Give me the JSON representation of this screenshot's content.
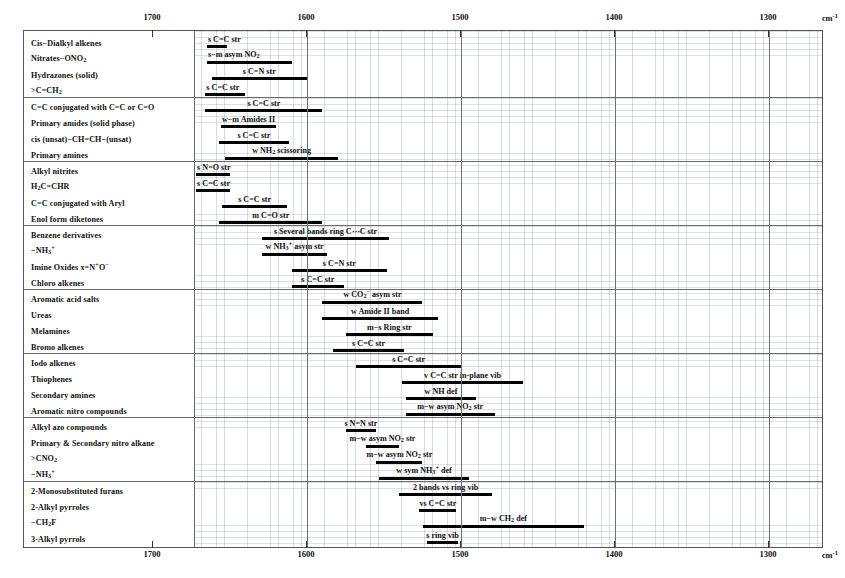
{
  "axis": {
    "unit": "cm",
    "unit_sup": "-1",
    "ticks": [
      1700,
      1600,
      1500,
      1400,
      1300
    ],
    "range_max": 1750,
    "range_min": 1250
  },
  "chart_data": {
    "type": "bar",
    "xlabel": "cm-1",
    "ylabel": "",
    "xlim": [
      1750,
      1250
    ],
    "grid": true,
    "legend": "none",
    "orientation": "horizontal-ranges",
    "categories": [
      "Cis−Dialkyl alkenes",
      "Nitrates−ONO2",
      "Hydrazones (solid)",
      ">C=CH2",
      "C=C conjugated with C=C or C=O",
      "Primary amides (solid phase)",
      "cis (unsat)−CH=CH−(unsat)",
      "Primary amines",
      "Alkyl nitrites",
      "H2C=CHR",
      "C=C conjugated with Aryl",
      "Enol form diketones",
      "Benzene derivatives",
      "−NH3+",
      "Imine Oxides x=N+O−",
      "Chloro alkenes",
      "Aromatic acid salts",
      "Ureas",
      "Melamines",
      "Bromo alkenes",
      "Iodo alkenes",
      "Thiophenes",
      "Secondary amines",
      "Aromatic nitro compounds",
      "Alkyl azo compounds",
      "Primary & Secondary nitro alkane",
      ">CNO2",
      "−NH3+",
      "2-Monosubstituted furans",
      "2-Alkyl pyrroles",
      "−CH2F",
      "3-Alkyl pyrrols"
    ],
    "ranges": [
      {
        "category": "Cis−Dialkyl alkenes",
        "from": 1665,
        "to": 1652,
        "annotation": "s C=C str"
      },
      {
        "category": "Nitrates−ONO2",
        "from": 1665,
        "to": 1610,
        "annotation": "s−m asym NO2"
      },
      {
        "category": "Hydrazones (solid)",
        "from": 1662,
        "to": 1600,
        "annotation": "s C=N str"
      },
      {
        "category": ">C=CH2",
        "from": 1666,
        "to": 1640,
        "annotation": "s C=C str"
      },
      {
        "category": "C=C conjugated with C=C or C=O",
        "from": 1666,
        "to": 1590,
        "annotation": "s C=C str"
      },
      {
        "category": "Primary amides (solid phase)",
        "from": 1656,
        "to": 1620,
        "annotation": "w−m Amides II"
      },
      {
        "category": "cis (unsat)−CH=CH−(unsat)",
        "from": 1657,
        "to": 1612,
        "annotation": "s C=C str"
      },
      {
        "category": "Primary amines",
        "from": 1653,
        "to": 1580,
        "annotation": "w NH2 scissoring"
      },
      {
        "category": "Alkyl nitrites",
        "from": 1672,
        "to": 1650,
        "annotation": "s N=O str"
      },
      {
        "category": "H2C=CHR",
        "from": 1672,
        "to": 1650,
        "annotation": "s C=C str"
      },
      {
        "category": "C=C conjugated with Aryl",
        "from": 1655,
        "to": 1613,
        "annotation": "s C=C str"
      },
      {
        "category": "Enol form diketones",
        "from": 1657,
        "to": 1590,
        "annotation": "m C=O str"
      },
      {
        "category": "Benzene derivatives",
        "from": 1629,
        "to": 1547,
        "annotation": "s Several bands ring C⋯C str"
      },
      {
        "category": "−NH3+",
        "from": 1629,
        "to": 1587,
        "annotation": "w NH3+ asym str"
      },
      {
        "category": "Imine Oxides x=N+O−",
        "from": 1610,
        "to": 1548,
        "annotation": "s C=N str"
      },
      {
        "category": "Chloro alkenes",
        "from": 1610,
        "to": 1576,
        "annotation": "s C=C str"
      },
      {
        "category": "Aromatic acid salts",
        "from": 1590,
        "to": 1525,
        "annotation": "w CO2− asym str"
      },
      {
        "category": "Ureas",
        "from": 1590,
        "to": 1515,
        "annotation": "w Amide II band"
      },
      {
        "category": "Melamines",
        "from": 1575,
        "to": 1518,
        "annotation": "m−s Ring str"
      },
      {
        "category": "Bromo alkenes",
        "from": 1583,
        "to": 1537,
        "annotation": "s C=C str"
      },
      {
        "category": "Iodo alkenes",
        "from": 1568,
        "to": 1500,
        "annotation": "s C=C str"
      },
      {
        "category": "Thiophenes",
        "from": 1538,
        "to": 1460,
        "annotation": "v C=C str in-plane vib"
      },
      {
        "category": "Secondary amines",
        "from": 1536,
        "to": 1490,
        "annotation": "w NH def"
      },
      {
        "category": "Aromatic nitro compounds",
        "from": 1536,
        "to": 1478,
        "annotation": "m−w asym NO2 str"
      },
      {
        "category": "Alkyl azo compounds",
        "from": 1575,
        "to": 1555,
        "annotation": "s N=N str"
      },
      {
        "category": "Primary & Secondary nitro alkane",
        "from": 1562,
        "to": 1540,
        "annotation": "m−w asym NO2 str"
      },
      {
        "category": ">CNO2",
        "from": 1555,
        "to": 1525,
        "annotation": "m−w asym NO2 str"
      },
      {
        "category": "−NH3+",
        "from": 1553,
        "to": 1495,
        "annotation": "w sym NH3+ def"
      },
      {
        "category": "2-Monosubstituted furans",
        "from": 1540,
        "to": 1480,
        "annotation": "2 bands vs ring vib"
      },
      {
        "category": "2-Alkyl pyrroles",
        "from": 1527,
        "to": 1503,
        "annotation": "vs C=C str"
      },
      {
        "category": "−CH2F",
        "from": 1525,
        "to": 1420,
        "annotation": "m−w CH2 def"
      },
      {
        "category": "3-Alkyl pyrrols",
        "from": 1522,
        "to": 1502,
        "annotation": "s ring vib"
      }
    ]
  },
  "rows": [
    {
      "label_html": "Cis−Dialkyl alkenes",
      "bar_from": 1665,
      "bar_to": 1652,
      "text_html": "s C=C str",
      "text_align": "left"
    },
    {
      "label_html": "Nitrates−ONO<sub>2</sub>",
      "bar_from": 1665,
      "bar_to": 1610,
      "text_html": "s−m asym NO<sub>2</sub>",
      "text_align": "left"
    },
    {
      "label_html": "Hydrazones (solid)",
      "bar_from": 1662,
      "bar_to": 1600,
      "text_html": "s C=N str",
      "text_align": "center"
    },
    {
      "label_html": "&gt;C=CH<sub>2</sub>",
      "bar_from": 1666,
      "bar_to": 1640,
      "text_html": "s C=C str",
      "text_align": "left"
    },
    {
      "label_html": "C=C conjugated with C=C or C=O",
      "bar_from": 1666,
      "bar_to": 1590,
      "text_html": "s C=C str",
      "text_align": "center"
    },
    {
      "label_html": "Primary amides (solid phase)",
      "bar_from": 1656,
      "bar_to": 1620,
      "text_html": "w−m Amides II",
      "text_align": "center"
    },
    {
      "label_html": "cis (unsat)−CH=CH−(unsat)",
      "bar_from": 1657,
      "bar_to": 1612,
      "text_html": "s C=C str",
      "text_align": "center"
    },
    {
      "label_html": "Primary amines",
      "bar_from": 1653,
      "bar_to": 1580,
      "text_html": "w NH<sub>2</sub> scissoring",
      "text_align": "center"
    },
    {
      "label_html": "Alkyl nitrites",
      "bar_from": 1672,
      "bar_to": 1650,
      "text_html": "s N=O str",
      "text_align": "left"
    },
    {
      "label_html": "H<sub>2</sub>C=CHR",
      "bar_from": 1672,
      "bar_to": 1650,
      "text_html": "s C=C str",
      "text_align": "left"
    },
    {
      "label_html": "C=C conjugated with Aryl",
      "bar_from": 1655,
      "bar_to": 1613,
      "text_html": "s C=C str",
      "text_align": "center"
    },
    {
      "label_html": "Enol form diketones",
      "bar_from": 1657,
      "bar_to": 1590,
      "text_html": "m C=O str",
      "text_align": "center"
    },
    {
      "label_html": "Benzene derivatives",
      "bar_from": 1629,
      "bar_to": 1547,
      "text_html": "s Several bands ring C⋯C str",
      "text_align": "center"
    },
    {
      "label_html": "−NH<sub>3</sub><sup>+</sup>",
      "bar_from": 1629,
      "bar_to": 1587,
      "text_html": "w NH<sub>3</sub><sup>+</sup> asym str",
      "text_align": "center"
    },
    {
      "label_html": "Imine Oxides x=N<sup>+</sup>O<sup>−</sup>",
      "bar_from": 1610,
      "bar_to": 1548,
      "text_html": "s C=N str",
      "text_align": "center"
    },
    {
      "label_html": "Chloro alkenes",
      "bar_from": 1610,
      "bar_to": 1576,
      "text_html": "s C=C str",
      "text_align": "center"
    },
    {
      "label_html": "Aromatic acid salts",
      "bar_from": 1590,
      "bar_to": 1525,
      "text_html": "w CO<sub>2</sub><sup>−</sup> asym str",
      "text_align": "center"
    },
    {
      "label_html": "Ureas",
      "bar_from": 1590,
      "bar_to": 1515,
      "text_html": "w Amide II band",
      "text_align": "center"
    },
    {
      "label_html": "Melamines",
      "bar_from": 1575,
      "bar_to": 1518,
      "text_html": "m−s Ring str",
      "text_align": "center"
    },
    {
      "label_html": "Bromo alkenes",
      "bar_from": 1583,
      "bar_to": 1537,
      "text_html": "s C=C str",
      "text_align": "center"
    },
    {
      "label_html": "Iodo alkenes",
      "bar_from": 1568,
      "bar_to": 1500,
      "text_html": "s C=C str",
      "text_align": "center"
    },
    {
      "label_html": "Thiophenes",
      "bar_from": 1538,
      "bar_to": 1460,
      "text_html": "v C=C str in-plane vib",
      "text_align": "center"
    },
    {
      "label_html": "Secondary amines",
      "bar_from": 1536,
      "bar_to": 1490,
      "text_html": "w NH def",
      "text_align": "center"
    },
    {
      "label_html": "Aromatic nitro compounds",
      "bar_from": 1536,
      "bar_to": 1478,
      "text_html": "m−w asym NO<sub>2</sub> str",
      "text_align": "center"
    },
    {
      "label_html": "Alkyl azo compounds",
      "bar_from": 1575,
      "bar_to": 1555,
      "text_html": "s N=N str",
      "text_align": "center"
    },
    {
      "label_html": "Primary &amp; Secondary nitro alkane",
      "bar_from": 1562,
      "bar_to": 1540,
      "text_html": "m−w asym NO<sub>2</sub> str",
      "text_align": "center"
    },
    {
      "label_html": "&gt;CNO<sub>2</sub>",
      "bar_from": 1555,
      "bar_to": 1525,
      "text_html": "m−w asym NO<sub>2</sub> str",
      "text_align": "center"
    },
    {
      "label_html": "−NH<sub>3</sub><sup>+</sup>",
      "bar_from": 1553,
      "bar_to": 1495,
      "text_html": "w sym NH<sub>3</sub><sup>+</sup> def",
      "text_align": "center"
    },
    {
      "label_html": "2-Monosubstituted furans",
      "bar_from": 1540,
      "bar_to": 1480,
      "text_html": "2 bands vs ring vib",
      "text_align": "center"
    },
    {
      "label_html": "2-Alkyl pyrroles",
      "bar_from": 1527,
      "bar_to": 1503,
      "text_html": "vs C=C str",
      "text_align": "center"
    },
    {
      "label_html": "−CH<sub>2</sub>F",
      "bar_from": 1525,
      "bar_to": 1420,
      "text_html": "m−w CH<sub>2</sub> def",
      "text_align": "center"
    },
    {
      "label_html": "3-Alkyl pyrrols",
      "bar_from": 1522,
      "bar_to": 1502,
      "text_html": "s ring vib",
      "text_align": "center"
    }
  ]
}
